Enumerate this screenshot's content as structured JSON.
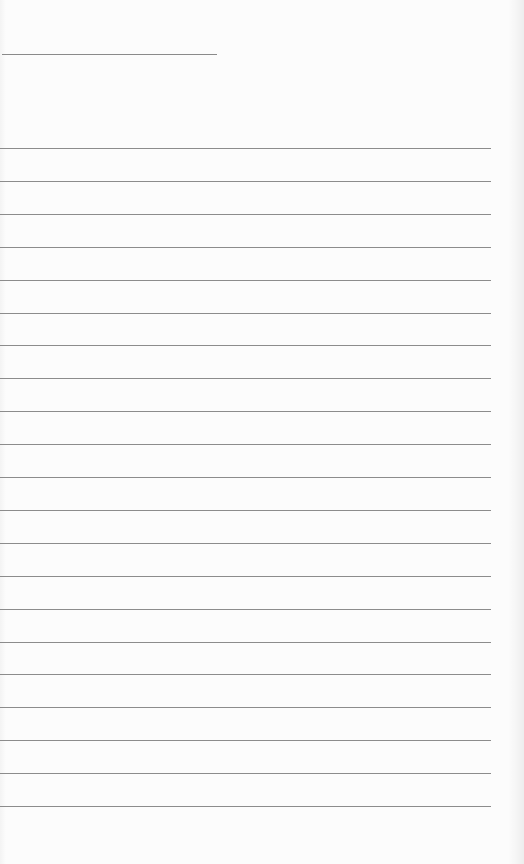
{
  "document": {
    "type": "blank lined writing sheet",
    "header_line": {
      "x": 2,
      "y": 54,
      "width": 215,
      "color": "#8a8a8a"
    },
    "ruled_lines": {
      "count": 21,
      "first_y": 148,
      "spacing": 32.9,
      "x_start": 0,
      "x_end": 491,
      "color": "#8c8c8c"
    },
    "background_color": "#fcfcfc",
    "text_content": []
  }
}
